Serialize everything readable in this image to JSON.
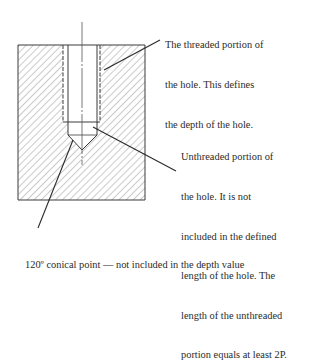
{
  "diagram": {
    "colors": {
      "line": "#3a3a3a",
      "hatch": "#8a8a8a",
      "background": "#ffffff",
      "text": "#2b2b2b"
    },
    "callouts": [
      {
        "id": "threaded-portion",
        "lines": [
          "The threaded portion of",
          "the hole. This defines",
          "the depth of the hole."
        ]
      },
      {
        "id": "unthreaded-portion",
        "lines": [
          "Unthreaded portion of",
          "the hole. It is not",
          "included in the defined",
          "length of the hole. The",
          "length of the unthreaded",
          "portion equals at least 2P."
        ]
      },
      {
        "id": "conical-point",
        "lines": [
          "120º conical point — not included in the depth value"
        ]
      }
    ]
  }
}
